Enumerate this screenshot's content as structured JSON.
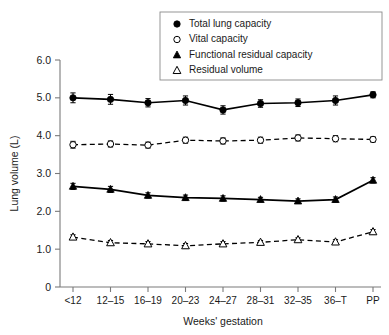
{
  "chart_data": {
    "type": "line",
    "title": "",
    "xlabel": "Weeks' gestation",
    "ylabel": "Lung volume (L)",
    "categories": [
      "<12",
      "12–15",
      "16–19",
      "20–23",
      "24–27",
      "28–31",
      "32–35",
      "36–T",
      "PP"
    ],
    "ylim": [
      0,
      6.0
    ],
    "ytick_labels": [
      "0",
      "1.0",
      "2.0",
      "3.0",
      "4.0",
      "5.0",
      "6.0"
    ],
    "ytick_values": [
      0,
      1.0,
      2.0,
      3.0,
      4.0,
      5.0,
      6.0
    ],
    "grid": false,
    "legend_position": "top-right",
    "series": [
      {
        "name": "Total lung capacity",
        "marker": "filled-circle",
        "line_style": "solid",
        "values": [
          5.0,
          4.96,
          4.87,
          4.93,
          4.68,
          4.85,
          4.87,
          4.93,
          5.08
        ],
        "errors": [
          0.13,
          0.13,
          0.11,
          0.12,
          0.11,
          0.1,
          0.1,
          0.12,
          0.08
        ]
      },
      {
        "name": "Vital capacity",
        "marker": "open-circle",
        "line_style": "dashed",
        "values": [
          3.76,
          3.78,
          3.75,
          3.88,
          3.86,
          3.88,
          3.94,
          3.92,
          3.9
        ],
        "errors": [
          0.09,
          0.08,
          0.08,
          0.08,
          0.08,
          0.08,
          0.08,
          0.08,
          0.07
        ]
      },
      {
        "name": "Functional residual capacity",
        "marker": "filled-triangle",
        "line_style": "solid",
        "values": [
          2.66,
          2.58,
          2.42,
          2.36,
          2.34,
          2.31,
          2.27,
          2.31,
          2.82
        ],
        "errors": [
          0.08,
          0.08,
          0.07,
          0.07,
          0.07,
          0.06,
          0.06,
          0.07,
          0.07
        ]
      },
      {
        "name": "Residual volume",
        "marker": "open-triangle",
        "line_style": "dashed",
        "values": [
          1.32,
          1.17,
          1.14,
          1.09,
          1.14,
          1.18,
          1.25,
          1.19,
          1.46
        ],
        "errors": [
          0.06,
          0.06,
          0.06,
          0.06,
          0.06,
          0.05,
          0.05,
          0.06,
          0.06
        ]
      }
    ]
  },
  "legend": {
    "items": [
      {
        "label": "Total lung capacity",
        "marker": "filled-circle"
      },
      {
        "label": "Vital capacity",
        "marker": "open-circle"
      },
      {
        "label": "Functional residual capacity",
        "marker": "filled-triangle"
      },
      {
        "label": "Residual volume",
        "marker": "open-triangle"
      }
    ]
  },
  "colors": {
    "ink": "#000000",
    "axis": "#7a7a7a",
    "background": "#ffffff"
  }
}
